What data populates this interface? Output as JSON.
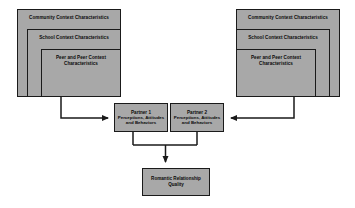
{
  "diagram": {
    "background_color": "#ffffff",
    "box_fill_color": "#a8a8a8",
    "box_border_color": "#1a1a1a",
    "connector_color": "#1a1a1a"
  },
  "left_group": {
    "community": "Community Context Characteristics",
    "school": "School Context Characteristics",
    "peer_line1": "Peer and Peer Context",
    "peer_line2": "Characteristics"
  },
  "right_group": {
    "community": "Community Context Characteristics",
    "school": "School Context Characteristics",
    "peer_line1": "Peer and Peer Context",
    "peer_line2": "Characteristics"
  },
  "partner1": {
    "title": "Partner 1",
    "line1": "Perceptions, Attitudes",
    "line2": "and Behaviors"
  },
  "partner2": {
    "title": "Partner 2",
    "line1": "Perceptions, Attitudes",
    "line2": "and Behaviors"
  },
  "outcome": {
    "line1": "Romantic Relationship",
    "line2": "Quality"
  },
  "connectors": {
    "left_to_partner1": "arrow from left context group to Partner 1",
    "right_to_partner2": "arrow from right context group to Partner 2",
    "partners_to_outcome": "joined arrow from both partners to Romantic Relationship Quality"
  }
}
